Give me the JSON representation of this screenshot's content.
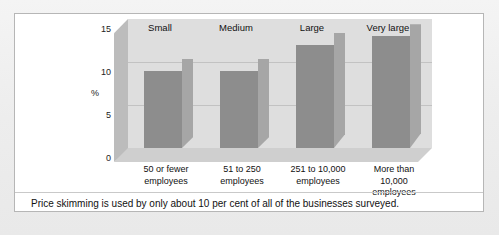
{
  "figure": {
    "caption": "Price skimming is used by only about 10 per cent of all of the businesses surveyed."
  },
  "chart_data": {
    "type": "bar",
    "title": "",
    "subtitle": "",
    "xlabel": "",
    "ylabel": "%",
    "categories": [
      "Small",
      "Medium",
      "Large",
      "Very large"
    ],
    "category_sublabels": [
      "50 or fewer employees",
      "51 to 250 employees",
      "251 to 10,000 employees",
      "More than 10,000 employees"
    ],
    "values": [
      9,
      9,
      12,
      13
    ],
    "ylim": [
      0,
      15
    ],
    "yticks": [
      0,
      5,
      10,
      15
    ],
    "ytick_labels": [
      "0",
      "5",
      "10",
      "15"
    ],
    "grid": true,
    "grid_axis": "y",
    "legend": "none",
    "three_d": true,
    "colors": {
      "bar_front": "#8d8d8d",
      "bar_side": "#a6a6a6",
      "bar_top": "#9b9b9b",
      "plot_background": "#dedede",
      "floor": "#cfcfcf",
      "gridline": "#c2c2c2",
      "figure_border": "#b6b6b6",
      "page_background": "#eeeeee"
    }
  },
  "axis": {
    "y_label": "%",
    "ticks": [
      {
        "label": "15",
        "value": 15
      },
      {
        "label": "10",
        "value": 10
      },
      {
        "label": "5",
        "value": 5
      },
      {
        "label": "0",
        "value": 0
      }
    ]
  },
  "bars": [
    {
      "header": "Small",
      "line1": "50 or fewer",
      "line2": "employees",
      "line3": "",
      "value": 9
    },
    {
      "header": "Medium",
      "line1": "51 to 250",
      "line2": "employees",
      "line3": "",
      "value": 9
    },
    {
      "header": "Large",
      "line1": "251 to 10,000",
      "line2": "employees",
      "line3": "",
      "value": 12
    },
    {
      "header": "Very large",
      "line1": "More than",
      "line2": "10,000",
      "line3": "employees",
      "value": 13
    }
  ]
}
